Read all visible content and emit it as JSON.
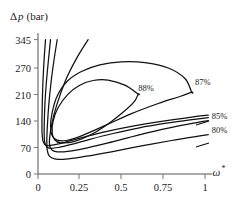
{
  "chart_data": {
    "type": "line",
    "title": "",
    "xlabel": "ω*",
    "ylabel": "Δp (bar)",
    "ylabel_delta": "Δ",
    "ylabel_p": "p",
    "ylabel_unit": "(bar)",
    "xlabel_symbol": "ω",
    "xlabel_superscript": "*",
    "xlim": [
      0,
      1.08
    ],
    "ylim": [
      0,
      360
    ],
    "xticks": [
      "0",
      "0.25",
      "0.5",
      "0.75",
      "1"
    ],
    "xtick_values": [
      0,
      0.25,
      0.5,
      0.75,
      1
    ],
    "yticks": [
      "0",
      "70",
      "140",
      "210",
      "270",
      "345"
    ],
    "ytick_values": [
      0,
      70,
      140,
      210,
      270,
      345
    ],
    "grid": false,
    "legend_position": "inline-labels",
    "series": [
      {
        "name": "88%",
        "label": "88%",
        "closed": true,
        "points": [
          [
            0.6,
            205
          ],
          [
            0.52,
            228
          ],
          [
            0.42,
            241
          ],
          [
            0.33,
            240
          ],
          [
            0.25,
            228
          ],
          [
            0.18,
            205
          ],
          [
            0.12,
            170
          ],
          [
            0.09,
            135
          ],
          [
            0.085,
            105
          ],
          [
            0.1,
            88
          ],
          [
            0.135,
            80
          ],
          [
            0.22,
            84
          ],
          [
            0.33,
            104
          ],
          [
            0.44,
            135
          ],
          [
            0.53,
            166
          ],
          [
            0.58,
            188
          ],
          [
            0.6,
            205
          ]
        ]
      },
      {
        "name": "87%",
        "label": "87%",
        "closed": true,
        "points": [
          [
            0.92,
            210
          ],
          [
            0.88,
            245
          ],
          [
            0.78,
            272
          ],
          [
            0.64,
            286
          ],
          [
            0.5,
            288
          ],
          [
            0.37,
            280
          ],
          [
            0.26,
            263
          ],
          [
            0.175,
            238
          ],
          [
            0.115,
            200
          ],
          [
            0.085,
            158
          ],
          [
            0.075,
            122
          ],
          [
            0.085,
            98
          ],
          [
            0.115,
            87
          ],
          [
            0.17,
            86
          ],
          [
            0.26,
            98
          ],
          [
            0.4,
            124
          ],
          [
            0.56,
            155
          ],
          [
            0.72,
            181
          ],
          [
            0.85,
            199
          ],
          [
            0.92,
            210
          ]
        ]
      },
      {
        "name": "85%",
        "label": "85%",
        "closed": false,
        "points": [
          [
            0.3,
            345
          ],
          [
            0.235,
            300
          ],
          [
            0.175,
            250
          ],
          [
            0.13,
            200
          ],
          [
            0.095,
            152
          ],
          [
            0.075,
            110
          ],
          [
            0.068,
            82
          ],
          [
            0.075,
            66
          ],
          [
            0.1,
            58
          ],
          [
            0.155,
            57
          ],
          [
            0.26,
            64
          ],
          [
            0.42,
            80
          ],
          [
            0.6,
            100
          ],
          [
            0.78,
            118
          ],
          [
            0.95,
            132
          ],
          [
            1.02,
            137
          ]
        ]
      },
      {
        "name": "80%",
        "label": "80%",
        "closed": false,
        "points": [
          [
            0.115,
            345
          ],
          [
            0.095,
            290
          ],
          [
            0.078,
            235
          ],
          [
            0.065,
            180
          ],
          [
            0.057,
            130
          ],
          [
            0.053,
            90
          ],
          [
            0.055,
            62
          ],
          [
            0.068,
            46
          ],
          [
            0.1,
            39
          ],
          [
            0.165,
            38
          ],
          [
            0.28,
            45
          ],
          [
            0.44,
            57
          ],
          [
            0.62,
            72
          ],
          [
            0.8,
            86
          ],
          [
            0.96,
            97
          ],
          [
            1.02,
            101
          ]
        ]
      },
      {
        "name": "inner-open-curve-1",
        "label": "",
        "closed": false,
        "points": [
          [
            0.075,
            345
          ],
          [
            0.062,
            290
          ],
          [
            0.05,
            235
          ],
          [
            0.042,
            185
          ],
          [
            0.038,
            140
          ],
          [
            0.037,
            105
          ],
          [
            0.04,
            82
          ],
          [
            0.052,
            70
          ],
          [
            0.075,
            66
          ],
          [
            0.12,
            68
          ],
          [
            0.2,
            76
          ],
          [
            0.31,
            89
          ],
          [
            0.45,
            104
          ],
          [
            0.6,
            118
          ],
          [
            0.78,
            131
          ],
          [
            0.95,
            141
          ],
          [
            1.02,
            145
          ]
        ]
      },
      {
        "name": "inner-open-curve-2",
        "label": "",
        "closed": false,
        "points": [
          [
            0.045,
            345
          ],
          [
            0.036,
            290
          ],
          [
            0.03,
            240
          ],
          [
            0.026,
            190
          ],
          [
            0.024,
            145
          ],
          [
            0.024,
            110
          ],
          [
            0.028,
            88
          ],
          [
            0.038,
            77
          ],
          [
            0.058,
            73
          ],
          [
            0.095,
            75
          ],
          [
            0.165,
            82
          ],
          [
            0.27,
            94
          ],
          [
            0.4,
            108
          ],
          [
            0.56,
            122
          ],
          [
            0.74,
            135
          ],
          [
            0.92,
            146
          ],
          [
            1.02,
            151
          ]
        ]
      }
    ],
    "annotations": [
      {
        "name": "label-88",
        "text": "88%",
        "x": 0.6,
        "y": 212,
        "anchor": "start"
      },
      {
        "name": "label-87",
        "text": "87%",
        "x": 0.94,
        "y": 228,
        "anchor": "start"
      },
      {
        "name": "label-85",
        "text": "85%",
        "x": 1.04,
        "y": 142,
        "anchor": "start"
      },
      {
        "name": "label-80",
        "text": "80%",
        "x": 1.04,
        "y": 106,
        "anchor": "start"
      }
    ]
  }
}
